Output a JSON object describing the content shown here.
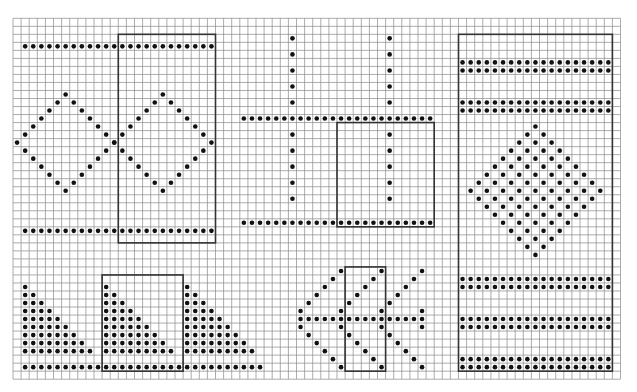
{
  "figure": {
    "background": "#ffffff",
    "grid": {
      "cols": 75,
      "rows": 45,
      "origin_x": 13,
      "origin_y": 18.3,
      "cell_w": 8.1,
      "cell_h": 8.02,
      "line_color": "#8a8a8a",
      "line_width": 0.7
    },
    "dot": {
      "color": "#111111",
      "radius": 2.3
    },
    "frame": {
      "color": "#333333",
      "width": 1.6
    },
    "panels": [
      {
        "name": "diamond-repeat-panel",
        "dot_rows": [
          {
            "row": 3,
            "col_from": 1,
            "col_to": 24
          },
          {
            "row": 26,
            "col_from": 1,
            "col_to": 24
          }
        ],
        "diamond_outlines": [
          {
            "center_row": 15,
            "center_col": 6,
            "radius": 6,
            "skip_right_tip": true
          },
          {
            "center_row": 15,
            "center_col": 18,
            "radius": 6
          }
        ],
        "frames": [
          {
            "col0": 13,
            "row0": 2,
            "col1": 25,
            "row1": 28
          }
        ]
      },
      {
        "name": "cross-grid-panel",
        "dot_rows": [
          {
            "row": 12,
            "col_from": 28,
            "col_to": 51
          },
          {
            "row": 25,
            "col_from": 28,
            "col_to": 51
          }
        ],
        "dot_cols": [
          {
            "col": 34,
            "rows": [
              2,
              4,
              6,
              8,
              10,
              14,
              16,
              18,
              20,
              22
            ]
          },
          {
            "col": 46,
            "rows": [
              2,
              4,
              6,
              8,
              10,
              14,
              16,
              18,
              20,
              22
            ]
          }
        ],
        "frames": [
          {
            "col0": 40,
            "row0": 13,
            "col1": 52,
            "row1": 26
          }
        ]
      },
      {
        "name": "triangle-repeat-panel",
        "dot_rows": [
          {
            "row": 43,
            "col_from": 1,
            "col_to": 30
          }
        ],
        "triangles": [
          {
            "top_row": 33,
            "start_col": 1,
            "size": 9
          },
          {
            "top_row": 33,
            "start_col": 11,
            "size": 9
          },
          {
            "top_row": 33,
            "start_col": 21,
            "size": 9
          }
        ],
        "frames": [
          {
            "col0": 11,
            "row0": 32,
            "col1": 21,
            "row1": 44
          }
        ]
      },
      {
        "name": "star-repeat-panel",
        "dot_rows": [
          {
            "row": 37,
            "col_from": 35,
            "col_to": 50
          }
        ],
        "points": [
          [
            31,
            40
          ],
          [
            31,
            45
          ],
          [
            31,
            50
          ],
          [
            32,
            39
          ],
          [
            32,
            44
          ],
          [
            32,
            49
          ],
          [
            33,
            38
          ],
          [
            33,
            43
          ],
          [
            33,
            48
          ],
          [
            34,
            37
          ],
          [
            34,
            42
          ],
          [
            34,
            47
          ],
          [
            35,
            36
          ],
          [
            35,
            41
          ],
          [
            35,
            46
          ],
          [
            36,
            35
          ],
          [
            36,
            40
          ],
          [
            36,
            45
          ],
          [
            36,
            50
          ],
          [
            38,
            35
          ],
          [
            38,
            40
          ],
          [
            38,
            45
          ],
          [
            38,
            50
          ],
          [
            39,
            36
          ],
          [
            39,
            41
          ],
          [
            39,
            46
          ],
          [
            40,
            37
          ],
          [
            40,
            42
          ],
          [
            40,
            47
          ],
          [
            41,
            38
          ],
          [
            41,
            43
          ],
          [
            41,
            48
          ],
          [
            42,
            39
          ],
          [
            42,
            44
          ],
          [
            42,
            49
          ],
          [
            43,
            40
          ],
          [
            43,
            45
          ],
          [
            43,
            50
          ]
        ],
        "frames": [
          {
            "col0": 41,
            "row0": 31,
            "col1": 46,
            "row1": 44
          }
        ]
      },
      {
        "name": "border-band-panel",
        "dot_rows": [
          {
            "row": 5,
            "col_from": 55,
            "col_to": 73
          },
          {
            "row": 6,
            "col_from": 55,
            "col_to": 73
          },
          {
            "row": 10,
            "col_from": 55,
            "col_to": 73
          },
          {
            "row": 11,
            "col_from": 55,
            "col_to": 73
          },
          {
            "row": 32,
            "col_from": 55,
            "col_to": 73
          },
          {
            "row": 33,
            "col_from": 55,
            "col_to": 73
          },
          {
            "row": 37,
            "col_from": 55,
            "col_to": 73
          },
          {
            "row": 38,
            "col_from": 55,
            "col_to": 73
          },
          {
            "row": 42,
            "col_from": 55,
            "col_to": 73
          },
          {
            "row": 43,
            "col_from": 55,
            "col_to": 73
          }
        ],
        "filled_diamonds": [
          {
            "center_row": 21,
            "center_col": 64,
            "radius": 8,
            "checker": true
          }
        ],
        "frames": [
          {
            "col0": 55,
            "row0": 2,
            "col1": 74,
            "row1": 44
          }
        ]
      }
    ]
  }
}
